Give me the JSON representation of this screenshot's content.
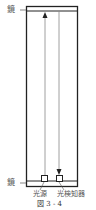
{
  "diagram": {
    "mirror_top_label": "鏡",
    "mirror_bottom_label": "鏡",
    "light_source_label": "光源",
    "detector_label": "光検知器",
    "caption": "図 3 - 4"
  },
  "colors": {
    "line": "#222222",
    "beam": "#888888",
    "text": "#555555"
  }
}
